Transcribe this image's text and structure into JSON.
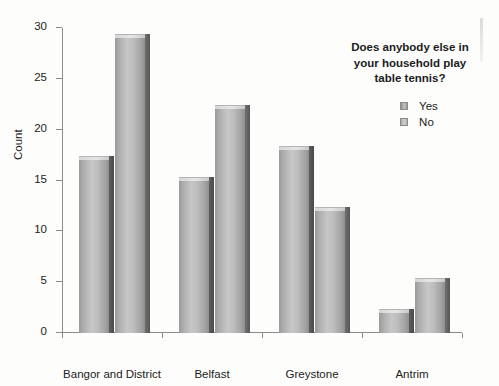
{
  "chart_data": {
    "type": "bar",
    "title": "",
    "categories": [
      "Bangor and District",
      "Belfast",
      "Greystone",
      "Antrim"
    ],
    "series": [
      {
        "name": "Yes",
        "values": [
          17,
          15,
          18,
          2
        ]
      },
      {
        "name": "No",
        "values": [
          29,
          22,
          12,
          5
        ]
      }
    ],
    "xlabel": "In which league do you compete?",
    "ylabel": "Count",
    "ylim": [
      0,
      30
    ],
    "yticks": [
      0,
      5,
      10,
      15,
      20,
      25,
      30
    ],
    "ytick_labels": [
      "0",
      "5",
      "10",
      "15",
      "20",
      "25",
      "30"
    ],
    "grid": false,
    "legend_position": "upper right",
    "legend_title": "Does anybody else in your household play table tennis?"
  },
  "legend": {
    "title_lines": [
      "Does anybody else in",
      "your household play",
      "table tennis?"
    ],
    "items": [
      {
        "label": "Yes"
      },
      {
        "label": "No"
      }
    ]
  },
  "axes": {
    "y_title": "Count",
    "x_title": "In which league do you compete?"
  }
}
